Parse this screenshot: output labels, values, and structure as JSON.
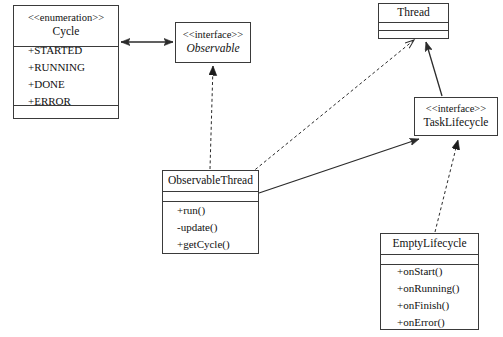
{
  "diagram": {
    "kind": "uml-class-diagram",
    "colors": {
      "background": "#ffffff",
      "stroke": "#3a3a3a",
      "edge": "#2b2b2b",
      "text": "#111111"
    },
    "classes": [
      {
        "id": "cycle",
        "stereotype": "<<enumeration>>",
        "name": "Cycle",
        "italic": false,
        "members": [
          "+STARTED",
          "+RUNNING",
          "+DONE",
          "+ERROR"
        ],
        "has_empty_compartment": true
      },
      {
        "id": "observable",
        "stereotype": "<<interface>>",
        "name": "Observable",
        "italic": true,
        "members": [],
        "has_empty_compartment": false
      },
      {
        "id": "thread",
        "stereotype": "",
        "name": "Thread",
        "italic": false,
        "members": [],
        "has_empty_compartment": true
      },
      {
        "id": "tasklifecycle",
        "stereotype": "<<interface>>",
        "name": "TaskLifecycle",
        "italic": false,
        "members": [],
        "has_empty_compartment": false
      },
      {
        "id": "observablethread",
        "stereotype": "",
        "name": "ObservableThread",
        "italic": false,
        "members": [
          "+run()",
          "-update()",
          "+getCycle()"
        ],
        "has_empty_compartment": true
      },
      {
        "id": "emptylifecycle",
        "stereotype": "",
        "name": "EmptyLifecycle",
        "italic": false,
        "members": [
          "+onStart()",
          "+onRunning()",
          "+onFinish()",
          "+onError()"
        ],
        "has_empty_compartment": true
      }
    ],
    "edges": [
      {
        "id": "cycle-observable",
        "from": "cycle",
        "to": "observable",
        "style": "solid",
        "arrow_start": "open-arrow",
        "arrow_end": "open-arrow",
        "relation": "association"
      },
      {
        "id": "observablethread-observable",
        "from": "observablethread",
        "to": "observable",
        "style": "dashed",
        "arrow_start": "none",
        "arrow_end": "closed-triangle",
        "relation": "realization"
      },
      {
        "id": "observablethread-thread",
        "from": "observablethread",
        "to": "thread",
        "style": "dashed",
        "arrow_start": "none",
        "arrow_end": "open-arrow",
        "relation": "dependency"
      },
      {
        "id": "observablethread-tasklifecycle",
        "from": "observablethread",
        "to": "tasklifecycle",
        "style": "solid",
        "arrow_start": "none",
        "arrow_end": "closed-triangle",
        "relation": "association"
      },
      {
        "id": "tasklifecycle-thread",
        "from": "tasklifecycle",
        "to": "thread",
        "style": "solid",
        "arrow_start": "none",
        "arrow_end": "closed-triangle",
        "relation": "association"
      },
      {
        "id": "emptylifecycle-tasklifecycle",
        "from": "emptylifecycle",
        "to": "tasklifecycle",
        "style": "dashed",
        "arrow_start": "none",
        "arrow_end": "closed-triangle",
        "relation": "realization"
      }
    ]
  }
}
